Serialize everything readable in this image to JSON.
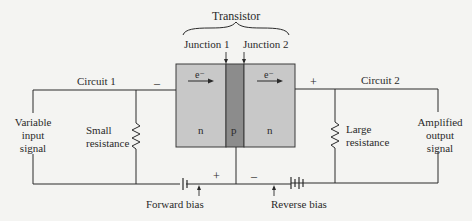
{
  "title": "Transistor",
  "junctions": {
    "junction1": "Junction 1",
    "junction2": "Junction 2"
  },
  "regions": {
    "left": "n",
    "middle": "p",
    "right": "n"
  },
  "electrons": {
    "left": "e⁻",
    "right": "e⁻"
  },
  "circuits": {
    "circuit1": "Circuit 1",
    "circuit2": "Circuit 2"
  },
  "left_side": {
    "signal_lines": [
      "Variable",
      "input",
      "signal"
    ],
    "resistor_lines": [
      "Small",
      "resistance"
    ]
  },
  "right_side": {
    "signal_lines": [
      "Amplified",
      "output",
      "signal"
    ],
    "resistor_lines": [
      "Large",
      "resistance"
    ]
  },
  "polarity": {
    "top_left": "–",
    "top_right": "+",
    "bottom_left": "+",
    "bottom_right": "–"
  },
  "biases": {
    "forward": "Forward bias",
    "reverse": "Reverse bias"
  },
  "colors": {
    "n_region": "#c8c8c8",
    "p_region": "#8c8c8c",
    "wire": "#2a2a2a",
    "background": "#f4f4f2"
  }
}
